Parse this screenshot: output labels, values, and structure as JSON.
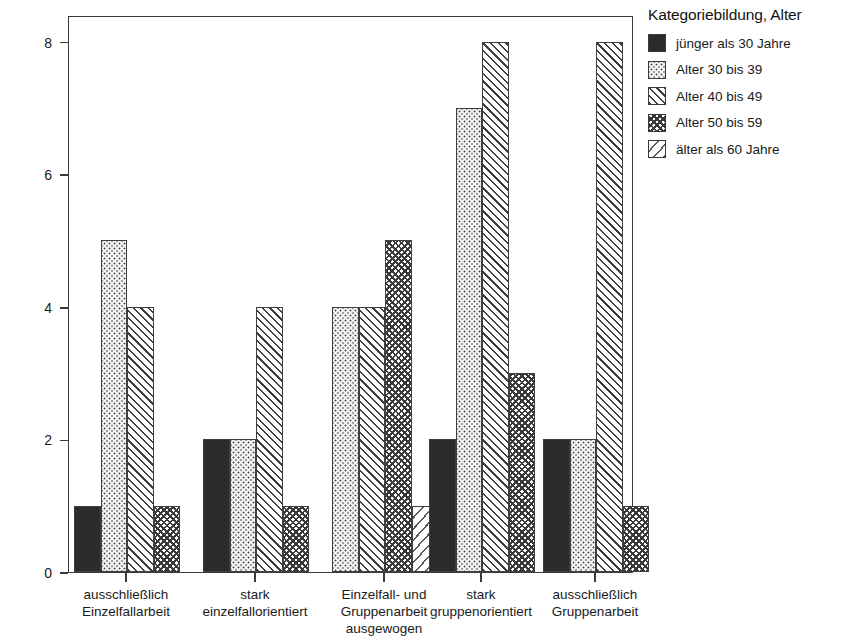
{
  "chart_data": {
    "type": "bar",
    "title": "",
    "xlabel": "",
    "ylabel": "Häufigkeit",
    "ylim": [
      0,
      8.4
    ],
    "yticks": [
      0,
      2,
      4,
      6,
      8
    ],
    "ytick_labels": [
      "0",
      "2",
      "4",
      "6",
      "8"
    ],
    "grid": false,
    "legend_position": "right",
    "legend_title": "Kategoriebildung, Alter",
    "categories": [
      "ausschließlich\nEinzelfallarbeit",
      "stark\neinzelfallorientiert",
      "Einzelfall- und\nGruppenarbeit\nausgewogen",
      "stark\ngruppenorientiert",
      "ausschließlich\nGruppenarbeit"
    ],
    "category_lines": [
      [
        "ausschließlich",
        "Einzelfallarbeit"
      ],
      [
        "stark",
        "einzelfallorientiert"
      ],
      [
        "Einzelfall- und",
        "Gruppenarbeit",
        "ausgewogen"
      ],
      [
        "stark",
        "gruppenorientiert"
      ],
      [
        "ausschließlich",
        "Gruppenarbeit"
      ]
    ],
    "series": [
      {
        "name": "jünger als 30 Jahre",
        "pattern": "solid",
        "values": [
          1,
          2,
          null,
          2,
          2
        ]
      },
      {
        "name": "Alter 30 bis 39",
        "pattern": "dots",
        "values": [
          5,
          2,
          4,
          7,
          2
        ]
      },
      {
        "name": "Alter 40 bis 49",
        "pattern": "hatch",
        "values": [
          4,
          4,
          4,
          8,
          8
        ]
      },
      {
        "name": "Alter 50 bis 59",
        "pattern": "cross",
        "values": [
          1,
          1,
          5,
          3,
          1
        ]
      },
      {
        "name": "älter als 60 Jahre",
        "pattern": "lightdiag",
        "values": [
          null,
          null,
          1,
          null,
          null
        ]
      }
    ]
  },
  "colors": {
    "axis": "#3a3a3a",
    "solid_fill": "#2b2b2b",
    "pattern_ink": "#3f3f3f",
    "background": "#ffffff",
    "text": "#1a1a1a"
  }
}
